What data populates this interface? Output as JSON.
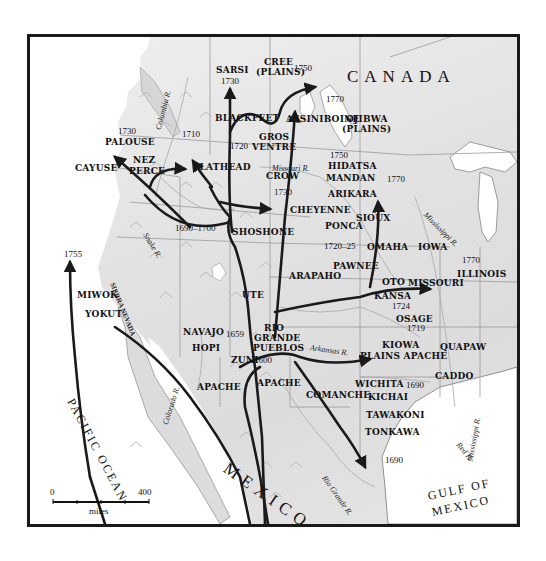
{
  "map": {
    "regions": {
      "canada": "CANADA",
      "mexico": "MEXICO",
      "pacific": "PACIFIC OCEAN",
      "gulf_line1": "GULF OF",
      "gulf_line2": "MEXICO"
    },
    "rivers": {
      "columbia": "Columbia R.",
      "snake": "Snake R.",
      "missouri": "Missouri R.",
      "mississippi_north": "Mississippi R.",
      "mississippi_south": "Mississippi R.",
      "arkansas": "Arkansas R.",
      "colorado": "Colorado R.",
      "rio_grande": "Rio Grande R.",
      "red": "Red R."
    },
    "mountains": {
      "sierra_nevada": "SIERRA NEVADA"
    },
    "tribes": {
      "sarsi": "SARSI",
      "cree_1": "CREE",
      "cree_2": "(PLAINS)",
      "blackfeet": "BLACKFEET",
      "assiniboine": "ASSINIBOINE",
      "ojibwa_1": "OJIBWA",
      "ojibwa_2": "(PLAINS)",
      "palouse": "PALOUSE",
      "gros_1": "GROS",
      "gros_2": "VENTRE",
      "cayuse": "CAYUSE",
      "nez_1": "NEZ",
      "nez_2": "PERCE",
      "flathead": "FLATHEAD",
      "crow": "CROW",
      "hidatsa": "HIDATSA",
      "mandan": "MANDAN",
      "arikara": "ARIKARA",
      "cheyenne": "CHEYENNE",
      "sioux": "SIOUX",
      "ponca": "PONCA",
      "shoshone": "SHOSHONE",
      "omaha": "OMAHA",
      "iowa": "IOWA",
      "pawnee": "PAWNEE",
      "illinois": "ILLINOIS",
      "arapaho": "ARAPAHO",
      "oto": "OTO",
      "missouri": "MISSOURI",
      "kansa": "KANSA",
      "osage": "OSAGE",
      "miwok": "MIWOK",
      "yokut": "YOKUT",
      "ute": "UTE",
      "navajo": "NAVAJO",
      "rio_1": "RIO",
      "rio_2": "GRANDE",
      "rio_3": "PUEBLOS",
      "hopi": "HOPI",
      "zuni": "ZUNI",
      "kiowa": "KIOWA",
      "plains_apache": "PLAINS APACHE",
      "quapaw": "QUAPAW",
      "apache_w": "APACHE",
      "apache_e": "APACHE",
      "caddo": "CADDO",
      "wichita": "WICHITA",
      "kichai": "KICHAI",
      "comanche": "COMANCHE",
      "tawakoni": "TAWAKONI",
      "tonkawa": "TONKAWA"
    },
    "years": {
      "sarsi": "1730",
      "cree": "1750",
      "palouse": "1730",
      "blackfeet": "1710",
      "gros_ventre": "1720",
      "ojibwa": "1770",
      "missouri_up": "1750",
      "crow": "1730",
      "mississippi_up": "1770",
      "shoshone": "1690–1700",
      "ponca": "1720–25",
      "illinois": "1770",
      "miwok": "1755",
      "osage": "1724",
      "navajo": "1659",
      "kiowa": "1719",
      "zuni": "1600",
      "wichita": "1690",
      "texas": "1690"
    },
    "scale": {
      "zero": "0",
      "max": "400",
      "unit": "miles"
    }
  },
  "colors": {
    "land": "#e2e2e2",
    "water": "#ffffff",
    "route": "#1a1a1a",
    "border": "#9a9a9a"
  }
}
